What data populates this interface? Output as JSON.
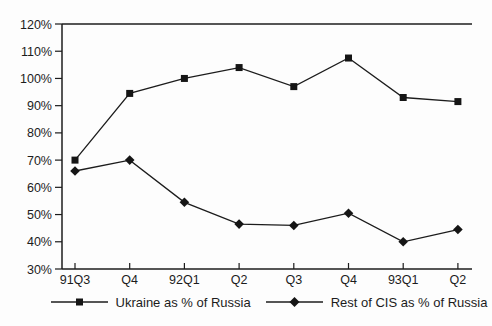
{
  "chart_data": {
    "type": "line",
    "categories": [
      "91Q3",
      "Q4",
      "92Q1",
      "Q2",
      "Q3",
      "Q4",
      "93Q1",
      "Q2"
    ],
    "series": [
      {
        "key": "ukraine",
        "name": "Ukraine as % of Russia",
        "marker": "square",
        "values": [
          70,
          94.5,
          100,
          104,
          97,
          107.5,
          93,
          91.5
        ]
      },
      {
        "key": "rest-of-cis",
        "name": "Rest of CIS as % of Russia",
        "marker": "diamond",
        "values": [
          66,
          70,
          54.5,
          46.5,
          46,
          50.5,
          40,
          44.5
        ]
      }
    ],
    "title": "",
    "xlabel": "",
    "ylabel": "",
    "ylim": [
      30,
      120
    ],
    "ytick_step": 10,
    "ytick_suffix": "%",
    "grid": false,
    "legend_position": "bottom",
    "line_color": "#1c1c1c",
    "background": "#fdfdfd"
  }
}
